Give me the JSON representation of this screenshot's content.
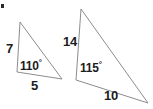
{
  "figure": {
    "background_color": "#ffffff",
    "stroke_color": "#8d8d8d",
    "text_color": "#1c1c1c",
    "marker": {
      "name": "corner-dot",
      "color": "#2b2b2b"
    },
    "shapes": [
      {
        "id": "left-triangle",
        "name": "Left triangle",
        "vertices": [
          [
            20,
            22
          ],
          [
            17,
            72
          ],
          [
            62,
            79
          ]
        ],
        "labels": {
          "side_left": "7",
          "side_bottom": "5",
          "angle": "110",
          "angle_unit": "°"
        }
      },
      {
        "id": "right-triangle",
        "name": "Right triangle",
        "vertices": [
          [
            81,
            9
          ],
          [
            76,
            80
          ],
          [
            148,
            103
          ]
        ],
        "labels": {
          "side_left": "14",
          "side_bottom": "10",
          "angle": "115",
          "angle_unit": "°"
        }
      }
    ]
  }
}
